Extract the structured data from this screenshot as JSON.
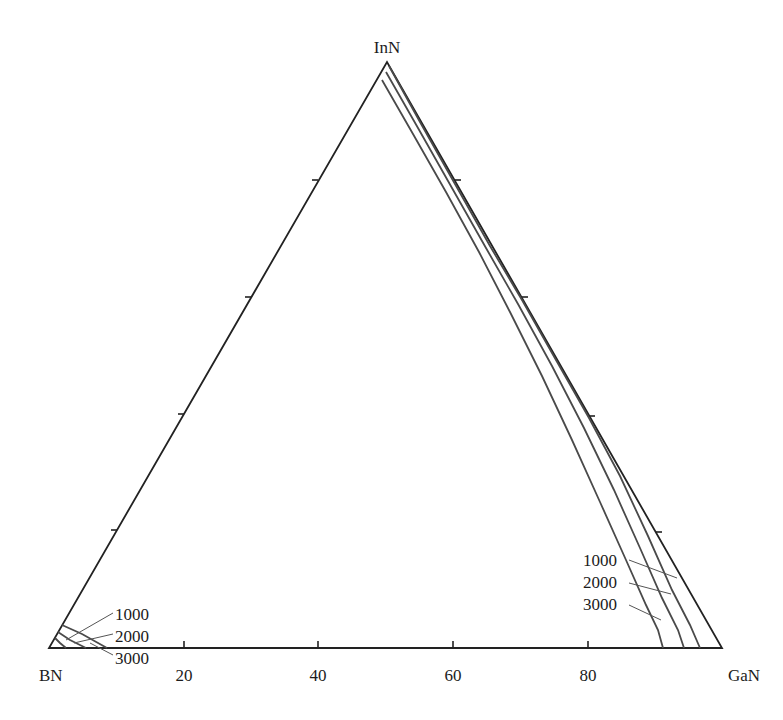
{
  "chart_data": {
    "type": "ternary",
    "title": "",
    "vertices": {
      "top": "InN",
      "left": "BN",
      "right": "GaN"
    },
    "axis": {
      "label_axis": "BN–GaN (GaN mol %)",
      "tick_labels": [
        "20",
        "40",
        "60",
        "80"
      ],
      "tick_values": [
        20,
        40,
        60,
        80
      ]
    },
    "grid": false,
    "legend": null,
    "series": [
      {
        "name": "1000",
        "units_note": "temperature label",
        "regions": [
          {
            "corner": "BN",
            "composition_points_BN_GaN_InN": [
              [
                96,
                0,
                4
              ],
              [
                98.5,
                1.5,
                0
              ]
            ]
          },
          {
            "corner": "GaN-InN",
            "composition_points_BN_GaN_InN": [
              [
                1,
                0,
                99
              ],
              [
                0,
                20,
                80
              ],
              [
                0,
                50,
                50
              ],
              [
                0.5,
                80,
                19.5
              ],
              [
                1.5,
                94,
                4.5
              ],
              [
                3,
                97,
                0
              ]
            ]
          }
        ]
      },
      {
        "name": "2000",
        "units_note": "temperature label",
        "regions": [
          {
            "corner": "BN",
            "composition_points_BN_GaN_InN": [
              [
                94,
                0,
                6
              ],
              [
                95,
                5,
                0
              ]
            ]
          },
          {
            "corner": "GaN-InN",
            "composition_points_BN_GaN_InN": [
              [
                2,
                0,
                98
              ],
              [
                1,
                25,
                74
              ],
              [
                1,
                50,
                49
              ],
              [
                2.5,
                78,
                19.5
              ],
              [
                4.5,
                90,
                5.5
              ],
              [
                5.5,
                94.5,
                0
              ]
            ]
          }
        ]
      },
      {
        "name": "3000",
        "units_note": "temperature label",
        "regions": [
          {
            "corner": "BN",
            "composition_points_BN_GaN_InN": [
              [
                92,
                0,
                8
              ],
              [
                91.5,
                8.5,
                0
              ]
            ]
          },
          {
            "corner": "GaN-InN",
            "composition_points_BN_GaN_InN": [
              [
                3.5,
                0,
                96.5
              ],
              [
                3,
                25,
                72
              ],
              [
                3,
                48,
                49
              ],
              [
                6,
                73,
                21
              ],
              [
                8.5,
                86,
                5.5
              ],
              [
                8.5,
                91.5,
                0
              ]
            ]
          }
        ]
      }
    ],
    "annotations": [
      {
        "text": "1000",
        "side": "left"
      },
      {
        "text": "2000",
        "side": "left"
      },
      {
        "text": "3000",
        "side": "left"
      },
      {
        "text": "1000",
        "side": "right"
      },
      {
        "text": "2000",
        "side": "right"
      },
      {
        "text": "3000",
        "side": "right"
      }
    ]
  },
  "render": {
    "vertices_px": {
      "BN": [
        49,
        648
      ],
      "GaN": [
        722,
        648
      ],
      "InN": [
        387,
        62
      ]
    },
    "vertex_labels": [
      {
        "text": "InN",
        "x": 387,
        "y": 53,
        "anchor": "middle"
      },
      {
        "text": "BN",
        "x": 39,
        "y": 681,
        "anchor": "start"
      },
      {
        "text": "GaN",
        "x": 760,
        "y": 681,
        "anchor": "end"
      }
    ],
    "bottom_ticks": [
      {
        "label": "20",
        "x": 184
      },
      {
        "label": "40",
        "x": 318
      },
      {
        "label": "60",
        "x": 453
      },
      {
        "label": "80",
        "x": 588
      }
    ],
    "left_ticks": [
      [
        117,
        530
      ],
      [
        184,
        414
      ],
      [
        251,
        297
      ],
      [
        318,
        180
      ]
    ],
    "right_ticks": [
      [
        656,
        532
      ],
      [
        589,
        416
      ],
      [
        522,
        297
      ],
      [
        455,
        180
      ]
    ],
    "curves": [
      {
        "name": "1000",
        "left_path": [
          [
            55,
            638
          ],
          [
            60,
            643
          ],
          [
            66,
            648
          ]
        ],
        "right_path": [
          [
            389,
            66
          ],
          [
            420,
            122
          ],
          [
            455,
            184
          ],
          [
            490,
            246
          ],
          [
            522,
            300
          ],
          [
            556,
            360
          ],
          [
            589,
            418
          ],
          [
            620,
            476
          ],
          [
            648,
            536
          ],
          [
            672,
            590
          ],
          [
            690,
            625
          ],
          [
            700,
            648
          ]
        ]
      },
      {
        "name": "2000",
        "left_path": [
          [
            58,
            632
          ],
          [
            70,
            640
          ],
          [
            86,
            648
          ]
        ],
        "right_path": [
          [
            386,
            72
          ],
          [
            418,
            128
          ],
          [
            452,
            188
          ],
          [
            486,
            248
          ],
          [
            518,
            304
          ],
          [
            552,
            366
          ],
          [
            584,
            428
          ],
          [
            614,
            490
          ],
          [
            640,
            548
          ],
          [
            662,
            598
          ],
          [
            678,
            630
          ],
          [
            684,
            648
          ]
        ]
      },
      {
        "name": "3000",
        "left_path": [
          [
            62,
            625
          ],
          [
            82,
            634
          ],
          [
            107,
            648
          ]
        ],
        "right_path": [
          [
            382,
            80
          ],
          [
            413,
            134
          ],
          [
            446,
            192
          ],
          [
            479,
            252
          ],
          [
            510,
            312
          ],
          [
            542,
            376
          ],
          [
            572,
            440
          ],
          [
            600,
            502
          ],
          [
            626,
            560
          ],
          [
            646,
            605
          ],
          [
            658,
            630
          ],
          [
            663,
            648
          ]
        ]
      }
    ],
    "labels_left": [
      {
        "text": "1000",
        "x": 115,
        "y": 620,
        "leader": [
          [
            113,
            613
          ],
          [
            66,
            640
          ]
        ]
      },
      {
        "text": "2000",
        "x": 115,
        "y": 642,
        "leader": [
          [
            113,
            634
          ],
          [
            74,
            643
          ]
        ]
      },
      {
        "text": "3000",
        "x": 115,
        "y": 664,
        "leader": [
          [
            113,
            655
          ],
          [
            90,
            643
          ]
        ]
      }
    ],
    "labels_right": [
      {
        "text": "1000",
        "x": 583,
        "y": 566,
        "leader": [
          [
            629,
            560
          ],
          [
            677,
            578
          ]
        ]
      },
      {
        "text": "2000",
        "x": 583,
        "y": 588,
        "leader": [
          [
            629,
            583
          ],
          [
            671,
            594
          ]
        ]
      },
      {
        "text": "3000",
        "x": 583,
        "y": 610,
        "leader": [
          [
            629,
            605
          ],
          [
            661,
            620
          ]
        ]
      }
    ]
  }
}
